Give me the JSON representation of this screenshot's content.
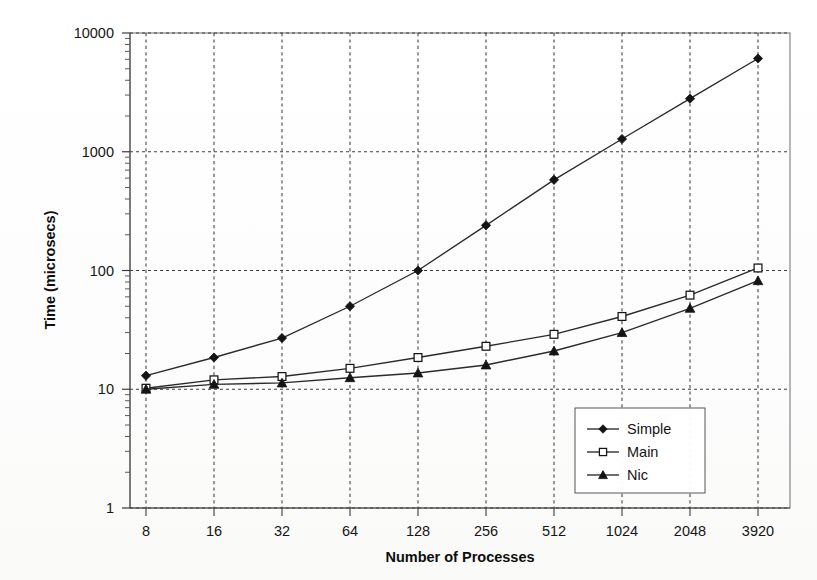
{
  "chart_data": {
    "type": "line",
    "title": "",
    "xlabel": "Number of Processes",
    "ylabel": "Time (microsecs)",
    "x_scale": "category",
    "y_scale": "log",
    "ylim": [
      1,
      10000
    ],
    "grid": "major-dashed-both-axes",
    "legend_position": "inside-lower-right",
    "categories": [
      "8",
      "16",
      "32",
      "64",
      "128",
      "256",
      "512",
      "1024",
      "2048",
      "3920"
    ],
    "y_tick_labels": [
      "10000",
      "1000",
      "100",
      "10",
      "1"
    ],
    "y_tick_values": [
      10000,
      1000,
      100,
      10,
      1
    ],
    "series": [
      {
        "name": "Simple",
        "marker": "filled-diamond",
        "color": "#141414",
        "values": [
          13,
          18.5,
          27,
          50,
          100,
          240,
          580,
          1280,
          2800,
          6100
        ]
      },
      {
        "name": "Main",
        "marker": "open-square",
        "color": "#141414",
        "values": [
          10.2,
          12,
          12.8,
          15,
          18.5,
          23,
          29,
          41,
          62,
          105
        ]
      },
      {
        "name": "Nic",
        "marker": "filled-triangle",
        "color": "#141414",
        "values": [
          10,
          11,
          11.3,
          12.5,
          13.7,
          16,
          21,
          30,
          48,
          82
        ]
      }
    ],
    "legend_entries": [
      "Simple",
      "Main",
      "Nic"
    ]
  },
  "axes": {
    "y_label": "Time (microsecs)",
    "x_label": "Number of Processes"
  }
}
